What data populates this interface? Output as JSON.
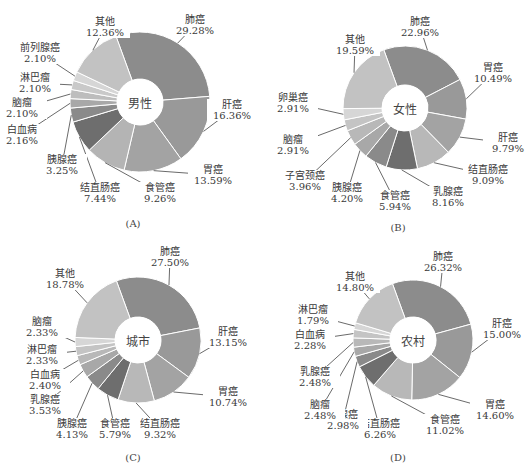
{
  "chart_data": [
    {
      "type": "pie",
      "panel": "A",
      "caption": "(A)",
      "center_label": "男性",
      "categories": [
        "肺癌",
        "肝癌",
        "胃癌",
        "食管癌",
        "结直肠癌",
        "胰腺癌",
        "白血病",
        "脑瘤",
        "淋巴瘤",
        "前列腺癌",
        "其他"
      ],
      "values": [
        29.28,
        16.36,
        13.59,
        9.26,
        7.44,
        3.25,
        2.16,
        2.1,
        2.1,
        2.1,
        12.36
      ],
      "labels": [
        "29.28%",
        "16.36%",
        "13.59%",
        "9.26%",
        "7.44%",
        "3.25%",
        "2.16%",
        "2.10%",
        "2.10%",
        "2.10%",
        "12.36%"
      ],
      "colors": [
        "#8c8c8c",
        "#999999",
        "#a3a3a3",
        "#b4b4b4",
        "#6e6e6e",
        "#8a8a8a",
        "#a8a8a8",
        "#bdbdbd",
        "#c9c9c9",
        "#d6d6d6",
        "#c2c2c2"
      ]
    },
    {
      "type": "pie",
      "panel": "B",
      "caption": "(B)",
      "center_label": "女性",
      "categories": [
        "肺癌",
        "胃癌",
        "肝癌",
        "结直肠癌",
        "乳腺癌",
        "食管癌",
        "胰腺癌",
        "子宫颈癌",
        "脑瘤",
        "卵巢癌",
        "其他"
      ],
      "values": [
        22.96,
        10.49,
        9.79,
        9.09,
        8.16,
        5.94,
        4.2,
        3.96,
        2.91,
        2.91,
        19.59
      ],
      "labels": [
        "22.96%",
        "10.49%",
        "9.79%",
        "9.09%",
        "8.16%",
        "5.94%",
        "4.20%",
        "3.96%",
        "2.91%",
        "2.91%",
        "19.59%"
      ],
      "colors": [
        "#8c8c8c",
        "#999999",
        "#a3a3a3",
        "#b8b8b8",
        "#6e6e6e",
        "#8a8a8a",
        "#a8a8a8",
        "#b8b8b8",
        "#c4c4c4",
        "#d6d6d6",
        "#c2c2c2"
      ]
    },
    {
      "type": "pie",
      "panel": "C",
      "caption": "(C)",
      "center_label": "城市",
      "categories": [
        "肺癌",
        "肝癌",
        "胃癌",
        "结直肠癌",
        "食管癌",
        "胰腺癌",
        "乳腺癌",
        "白血病",
        "淋巴瘤",
        "脑瘤",
        "其他"
      ],
      "values": [
        27.5,
        13.15,
        10.74,
        9.32,
        5.79,
        4.13,
        3.53,
        2.4,
        2.33,
        2.33,
        18.78
      ],
      "labels": [
        "27.50%",
        "13.15%",
        "10.74%",
        "9.32%",
        "5.79%",
        "4.13%",
        "3.53%",
        "2.40%",
        "2.33%",
        "2.33%",
        "18.78%"
      ],
      "colors": [
        "#8c8c8c",
        "#999999",
        "#a3a3a3",
        "#b8b8b8",
        "#6e6e6e",
        "#8a8a8a",
        "#a8a8a8",
        "#b8b8b8",
        "#c4c4c4",
        "#d6d6d6",
        "#c2c2c2"
      ]
    },
    {
      "type": "pie",
      "panel": "D",
      "caption": "(D)",
      "center_label": "农村",
      "categories": [
        "肺癌",
        "肝癌",
        "胃癌",
        "食管癌",
        "结直肠癌",
        "胰腺癌",
        "脑瘤",
        "乳腺癌",
        "白血病",
        "淋巴瘤",
        "其他"
      ],
      "values": [
        26.32,
        15.0,
        14.6,
        11.02,
        6.26,
        2.98,
        2.48,
        2.48,
        2.28,
        1.79,
        14.8
      ],
      "labels": [
        "26.32%",
        "15.00%",
        "14.60%",
        "11.02%",
        "6.26%",
        "2.98%",
        "2.48%",
        "2.48%",
        "2.28%",
        "1.79%",
        "14.80%"
      ],
      "colors": [
        "#8c8c8c",
        "#999999",
        "#a3a3a3",
        "#b8b8b8",
        "#6e6e6e",
        "#8a8a8a",
        "#a8a8a8",
        "#b8b8b8",
        "#c4c4c4",
        "#d6d6d6",
        "#c2c2c2"
      ]
    }
  ],
  "layout": {
    "panels": [
      {
        "left": 0,
        "top": 0,
        "cx": 140,
        "cy": 102,
        "r": 70,
        "ir": 23,
        "label_pos": [
          [
            195,
            20
          ],
          [
            232,
            105
          ],
          [
            213,
            170
          ],
          [
            160,
            188
          ],
          [
            100,
            188
          ],
          [
            62,
            160
          ],
          [
            22,
            130
          ],
          [
            22,
            103
          ],
          [
            35,
            78
          ],
          [
            40,
            48
          ],
          [
            105,
            22
          ]
        ],
        "caption_pos": [
          133,
          218
        ]
      },
      {
        "left": 265,
        "top": 0,
        "cx": 140,
        "cy": 108,
        "r": 62,
        "ir": 23,
        "label_pos": [
          [
            155,
            22
          ],
          [
            228,
            68
          ],
          [
            243,
            138
          ],
          [
            223,
            170
          ],
          [
            183,
            192
          ],
          [
            130,
            196
          ],
          [
            82,
            188
          ],
          [
            40,
            176
          ],
          [
            28,
            140
          ],
          [
            28,
            98
          ],
          [
            90,
            40
          ]
        ],
        "caption_pos": [
          133,
          222
        ]
      },
      {
        "left": 0,
        "top": 232,
        "cx": 138,
        "cy": 108,
        "r": 63,
        "ir": 23,
        "label_pos": [
          [
            170,
            20
          ],
          [
            228,
            100
          ],
          [
            228,
            160
          ],
          [
            160,
            192
          ],
          [
            115,
            192
          ],
          [
            72,
            192
          ],
          [
            45,
            168
          ],
          [
            45,
            143
          ],
          [
            42,
            118
          ],
          [
            42,
            90
          ],
          [
            65,
            42
          ]
        ],
        "caption_pos": [
          133,
          220
        ]
      },
      {
        "left": 265,
        "top": 232,
        "cx": 148,
        "cy": 108,
        "r": 60,
        "ir": 23,
        "label_pos": [
          [
            178,
            25
          ],
          [
            237,
            92
          ],
          [
            230,
            173
          ],
          [
            180,
            188
          ],
          [
            115,
            192
          ],
          [
            78,
            183
          ],
          [
            55,
            173
          ],
          [
            50,
            140
          ],
          [
            45,
            103
          ],
          [
            48,
            78
          ],
          [
            90,
            45
          ]
        ],
        "caption_pos": [
          133,
          220
        ]
      }
    ]
  }
}
